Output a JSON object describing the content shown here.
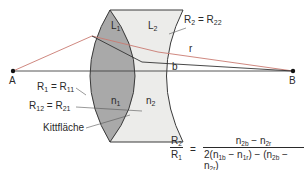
{
  "diagram": {
    "points": {
      "A": "A",
      "B": "B"
    },
    "lens_labels": {
      "L1": {
        "base": "L",
        "sub": "1"
      },
      "L2": {
        "base": "L",
        "sub": "2"
      },
      "n1": {
        "base": "n",
        "sub": "1"
      },
      "n2": {
        "base": "n",
        "sub": "2"
      }
    },
    "ray_labels": {
      "r": "r",
      "b": "b"
    },
    "annotations": {
      "R2_eq": {
        "lhs": "R",
        "lhs_sub": "2",
        "eq": " = ",
        "rhs": "R",
        "rhs_sub": "22"
      },
      "R1_eq": {
        "lhs": "R",
        "lhs_sub": "1",
        "eq": " = ",
        "rhs": "R",
        "rhs_sub": "11"
      },
      "R12_eq": {
        "lhs": "R",
        "lhs_sub": "12",
        "eq": " = ",
        "rhs": "R",
        "rhs_sub": "21"
      },
      "cement": "Kittfläche"
    },
    "colors": {
      "lens1_fill": "#a9a9a9",
      "lens2_fill": "#ececea",
      "outline": "#3a3a3a",
      "red_ray": "#c97a72",
      "dark_ray": "#333333",
      "axis": "#444444"
    }
  },
  "formula": {
    "lhs_num": {
      "base": "R",
      "sub": "2"
    },
    "lhs_den": {
      "base": "R",
      "sub": "1"
    },
    "equals": "=",
    "rhs_num": {
      "t1": "n",
      "t1_sub": "2b",
      "minus": " − ",
      "t2": "n",
      "t2_sub": "2r"
    },
    "rhs_den": {
      "prefix": "2(",
      "a": "n",
      "a_sub": "1b",
      "m1": " − ",
      "b": "n",
      "b_sub": "1r",
      "mid": ") − (",
      "c": "n",
      "c_sub": "2b",
      "m2": " − ",
      "d": "n",
      "d_sub": "2r",
      "suffix": ")"
    }
  }
}
